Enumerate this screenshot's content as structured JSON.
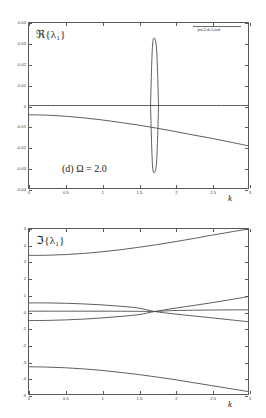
{
  "figure": {
    "background": "#ffffff",
    "line_color": "#4d4d4d",
    "axis_color": "#5a5a5a"
  },
  "panels": [
    {
      "id": "top",
      "annotation": "(d) Ω = 2.0",
      "legend": "'pre-2-rk-1-real'",
      "chart_data": {
        "type": "line",
        "title": "",
        "subtitle": "(d) Ω = 2.0",
        "xlabel": "k",
        "ylabel": "ℜ{λ₁}",
        "xlim": [
          0,
          3
        ],
        "ylim": [
          -0.04,
          0.04
        ],
        "xticks": [
          0,
          0.5,
          1,
          1.5,
          2,
          2.5,
          3
        ],
        "xticklabels": [
          "0",
          "0.5",
          "1",
          "1.5",
          "2",
          "2.5",
          "3"
        ],
        "yticks": [
          -0.04,
          -0.03,
          -0.02,
          -0.01,
          0,
          0.01,
          0.02,
          0.03,
          0.04
        ],
        "yticklabels": [
          "-0.04",
          "-0.03",
          "-0.02",
          "-0.01",
          "0",
          "0.01",
          "0.02",
          "0.03",
          "0.04"
        ],
        "grid": false,
        "legend_position": "top-right",
        "series": [
          {
            "name": "zero-branch",
            "comment": "flat branch at Re = 0 across all k",
            "x": [
              0,
              0.5,
              1,
              1.5,
              2,
              2.5,
              3
            ],
            "values": [
              0,
              0,
              0,
              0,
              0,
              0,
              0
            ]
          },
          {
            "name": "decaying-branch",
            "comment": "slowly decreasing negative branch from about -0.0045 to -0.0195",
            "x": [
              0,
              0.25,
              0.5,
              0.75,
              1,
              1.25,
              1.5,
              1.75,
              2,
              2.25,
              2.5,
              2.75,
              3
            ],
            "values": [
              -0.0045,
              -0.0047,
              -0.0052,
              -0.006,
              -0.007,
              -0.0082,
              -0.0095,
              -0.011,
              -0.0126,
              -0.0143,
              -0.0159,
              -0.0177,
              -0.0195
            ]
          },
          {
            "name": "instability-bubble-upper",
            "comment": "narrow closed instability bubble, upper half",
            "x": [
              1.665,
              1.69,
              1.72,
              1.75,
              1.775
            ],
            "values": [
              0.0,
              0.028,
              0.0325,
              0.026,
              0.0
            ]
          },
          {
            "name": "instability-bubble-lower",
            "comment": "narrow closed instability bubble, lower half",
            "x": [
              1.665,
              1.69,
              1.72,
              1.75,
              1.775
            ],
            "values": [
              0.0,
              -0.028,
              -0.0325,
              -0.026,
              0.0
            ]
          }
        ]
      }
    },
    {
      "id": "bottom",
      "annotation": "",
      "legend": "'pre-2-rk-1-imag'",
      "chart_data": {
        "type": "line",
        "title": "",
        "xlabel": "k",
        "ylabel": "ℑ{λ₁}",
        "xlim": [
          0,
          3
        ],
        "ylim": [
          -5,
          5
        ],
        "xticks": [
          0,
          0.5,
          1,
          1.5,
          2,
          2.5,
          3
        ],
        "xticklabels": [
          "0",
          "0.5",
          "1",
          "1.5",
          "2",
          "2.5",
          "3"
        ],
        "yticks": [
          -5,
          -4,
          -3,
          -2,
          -1,
          0,
          1,
          2,
          3,
          4,
          5
        ],
        "yticklabels": [
          "-5",
          "-4",
          "-3",
          "-2",
          "-1",
          "0",
          "1",
          "2",
          "3",
          "4",
          "5"
        ],
        "grid": false,
        "legend_position": "top-right",
        "series": [
          {
            "name": "upper-outer-branch",
            "comment": "rises from about 3.4 at k=0 to 5 at k=3",
            "x": [
              0,
              0.25,
              0.5,
              0.75,
              1,
              1.25,
              1.5,
              1.75,
              2,
              2.25,
              2.5,
              2.75,
              3
            ],
            "values": [
              3.4,
              3.41,
              3.45,
              3.52,
              3.62,
              3.74,
              3.89,
              4.05,
              4.23,
              4.42,
              4.62,
              4.81,
              5.0
            ]
          },
          {
            "name": "lower-outer-branch",
            "comment": "falls from about -3.35 at k=0 to about -4.85 at k=3",
            "x": [
              0,
              0.25,
              0.5,
              0.75,
              1,
              1.25,
              1.5,
              1.75,
              2,
              2.25,
              2.5,
              2.75,
              3
            ],
            "values": [
              -3.35,
              -3.37,
              -3.41,
              -3.48,
              -3.57,
              -3.69,
              -3.82,
              -3.97,
              -4.13,
              -4.31,
              -4.49,
              -4.67,
              -4.85
            ]
          },
          {
            "name": "inner-upper-collapsing",
            "comment": "starts near 0.52, decreases to 0 at the pinch near k=1.72, continues to about -0.62",
            "x": [
              0,
              0.25,
              0.5,
              0.75,
              1,
              1.25,
              1.5,
              1.72,
              2,
              2.25,
              2.5,
              2.75,
              3
            ],
            "values": [
              0.52,
              0.52,
              0.5,
              0.46,
              0.4,
              0.32,
              0.21,
              0.0,
              -0.15,
              -0.27,
              -0.38,
              -0.5,
              -0.62
            ]
          },
          {
            "name": "inner-lower-collapsing",
            "comment": "starts near -0.55, increases to 0 at the pinch near k=1.72, continues to about 0.90",
            "x": [
              0,
              0.25,
              0.5,
              0.75,
              1,
              1.25,
              1.5,
              1.72,
              2,
              2.25,
              2.5,
              2.75,
              3
            ],
            "values": [
              -0.55,
              -0.54,
              -0.51,
              -0.46,
              -0.39,
              -0.3,
              -0.19,
              0.0,
              0.2,
              0.36,
              0.53,
              0.71,
              0.9
            ]
          },
          {
            "name": "near-zero-branch",
            "comment": "nearly flat branch just above zero, slight rise after the pinch",
            "x": [
              0,
              0.5,
              1,
              1.5,
              1.72,
              2,
              2.5,
              3
            ],
            "values": [
              0.02,
              0.02,
              0.02,
              0.01,
              0.0,
              0.06,
              0.09,
              0.1
            ]
          }
        ]
      }
    }
  ]
}
